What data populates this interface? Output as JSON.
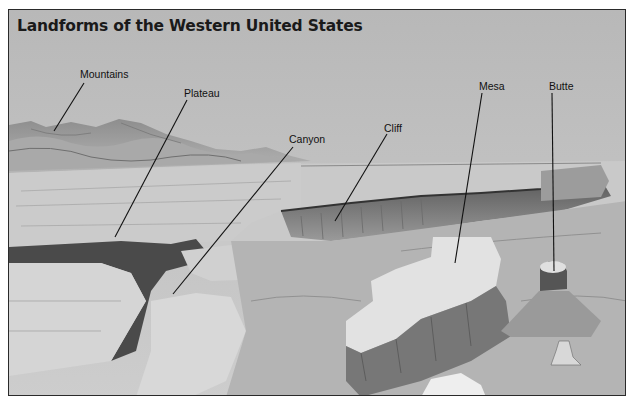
{
  "title": "Landforms of the Western United States",
  "labels": [
    {
      "id": "mountains",
      "text": "Mountains",
      "x": 80,
      "y": 68
    },
    {
      "id": "plateau",
      "text": "Plateau",
      "x": 184,
      "y": 87
    },
    {
      "id": "canyon",
      "text": "Canyon",
      "x": 289,
      "y": 133
    },
    {
      "id": "cliff",
      "text": "Cliff",
      "x": 384,
      "y": 122
    },
    {
      "id": "mesa",
      "text": "Mesa",
      "x": 479,
      "y": 80
    },
    {
      "id": "butte",
      "text": "Butte",
      "x": 549,
      "y": 80
    }
  ],
  "leader_lines": [
    {
      "for": "mountains",
      "x1": 83,
      "y1": 82,
      "x2": 53,
      "y2": 130
    },
    {
      "for": "plateau",
      "x1": 186,
      "y1": 99,
      "x2": 114,
      "y2": 236
    },
    {
      "for": "canyon",
      "x1": 292,
      "y1": 146,
      "x2": 172,
      "y2": 293
    },
    {
      "for": "cliff",
      "x1": 386,
      "y1": 133,
      "x2": 334,
      "y2": 220
    },
    {
      "for": "mesa",
      "x1": 481,
      "y1": 92,
      "x2": 454,
      "y2": 262
    },
    {
      "for": "butte",
      "x1": 551,
      "y1": 92,
      "x2": 553,
      "y2": 270
    }
  ],
  "colors": {
    "sky": "#c2c2c2",
    "mountains": "#9a9a9a",
    "plateau": "#cfcfcf",
    "canyon_shadow": "#4a4a4a",
    "cliff_face": "#8c8c8c",
    "mesa_top": "#e2e2e2",
    "frame": "#2a2a2a"
  }
}
